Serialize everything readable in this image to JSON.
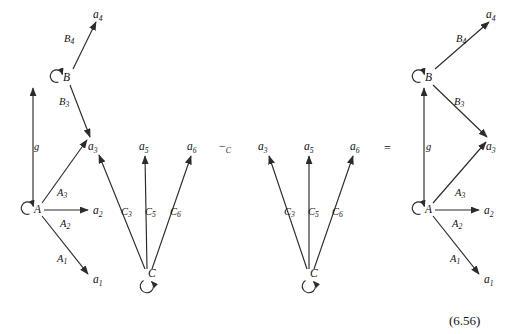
{
  "figure": {
    "equation_number": "(6.56)",
    "operators": [
      {
        "id": "minus-c",
        "symbol": "−",
        "subscript": "C",
        "x": 222,
        "y": 150
      },
      {
        "id": "equals",
        "symbol": "=",
        "subscript": "",
        "x": 388,
        "y": 152
      }
    ]
  },
  "diagrams": [
    {
      "id": "left-diagram",
      "nodes": [
        {
          "id": "B",
          "label": "B",
          "sub": "",
          "x": 63,
          "y": 77,
          "loop": "left"
        },
        {
          "id": "A",
          "label": "A",
          "sub": "",
          "x": 34,
          "y": 209,
          "loop": "left"
        },
        {
          "id": "C",
          "label": "C",
          "sub": "",
          "x": 148,
          "y": 277,
          "loop": "below"
        },
        {
          "id": "a4",
          "label": "a",
          "sub": "4",
          "x": 96,
          "y": 14,
          "loop": ""
        },
        {
          "id": "a3",
          "label": "a",
          "sub": "3",
          "x": 91,
          "y": 148,
          "loop": ""
        },
        {
          "id": "a5",
          "label": "a",
          "sub": "5",
          "x": 142,
          "y": 148,
          "loop": ""
        },
        {
          "id": "a6",
          "label": "a",
          "sub": "6",
          "x": 190,
          "y": 148,
          "loop": ""
        },
        {
          "id": "a2",
          "label": "a",
          "sub": "2",
          "x": 95,
          "y": 212,
          "loop": ""
        },
        {
          "id": "a1",
          "label": "a",
          "sub": "1",
          "x": 95,
          "y": 280,
          "loop": ""
        }
      ],
      "edges": [
        {
          "id": "B-a4",
          "from": "B",
          "to": "a4",
          "label": "B",
          "sub": "4",
          "lx": 67,
          "ly": 38
        },
        {
          "id": "B-a3",
          "from": "B",
          "to": "a3",
          "label": "B",
          "sub": "3",
          "lx": 62,
          "ly": 101
        },
        {
          "id": "A-B",
          "from": "A",
          "to": "B",
          "label": "g",
          "sub": "",
          "lx": 36,
          "ly": 146
        },
        {
          "id": "A-a3",
          "from": "A",
          "to": "a3",
          "label": "A",
          "sub": "3",
          "lx": 60,
          "ly": 192
        },
        {
          "id": "A-a2",
          "from": "A",
          "to": "a2",
          "label": "A",
          "sub": "2",
          "lx": 63,
          "ly": 223
        },
        {
          "id": "A-a1",
          "from": "A",
          "to": "a1",
          "label": "A",
          "sub": "1",
          "lx": 60,
          "ly": 258
        },
        {
          "id": "C-a3",
          "from": "C",
          "to": "a3",
          "label": "C",
          "sub": "3",
          "lx": 124,
          "ly": 211
        },
        {
          "id": "C-a5",
          "from": "C",
          "to": "a5",
          "label": "C",
          "sub": "5",
          "lx": 148,
          "ly": 211
        },
        {
          "id": "C-a6",
          "from": "C",
          "to": "a6",
          "label": "C",
          "sub": "6",
          "lx": 173,
          "ly": 211
        }
      ]
    },
    {
      "id": "middle-diagram",
      "nodes": [
        {
          "id": "C",
          "label": "C",
          "sub": "",
          "x": 310,
          "y": 277,
          "loop": "below"
        },
        {
          "id": "a3",
          "label": "a",
          "sub": "3",
          "x": 261,
          "y": 148,
          "loop": ""
        },
        {
          "id": "a5",
          "label": "a",
          "sub": "5",
          "x": 307,
          "y": 148,
          "loop": ""
        },
        {
          "id": "a6",
          "label": "a",
          "sub": "6",
          "x": 353,
          "y": 148,
          "loop": ""
        }
      ],
      "edges": [
        {
          "id": "C-a3",
          "from": "C",
          "to": "a3",
          "label": "C",
          "sub": "3",
          "lx": 287,
          "ly": 211
        },
        {
          "id": "C-a5",
          "from": "C",
          "to": "a5",
          "label": "C",
          "sub": "5",
          "lx": 311,
          "ly": 211
        },
        {
          "id": "C-a6",
          "from": "C",
          "to": "a6",
          "label": "C",
          "sub": "6",
          "lx": 335,
          "ly": 211
        }
      ]
    },
    {
      "id": "right-diagram",
      "nodes": [
        {
          "id": "B",
          "label": "B",
          "sub": "",
          "x": 425,
          "y": 77,
          "loop": "left"
        },
        {
          "id": "A",
          "label": "A",
          "sub": "",
          "x": 425,
          "y": 209,
          "loop": "left"
        },
        {
          "id": "a4",
          "label": "a",
          "sub": "4",
          "x": 489,
          "y": 14,
          "loop": ""
        },
        {
          "id": "a3",
          "label": "a",
          "sub": "3",
          "x": 489,
          "y": 148,
          "loop": ""
        },
        {
          "id": "a2",
          "label": "a",
          "sub": "2",
          "x": 486,
          "y": 212,
          "loop": ""
        },
        {
          "id": "a1",
          "label": "a",
          "sub": "1",
          "x": 486,
          "y": 280,
          "loop": ""
        }
      ],
      "edges": [
        {
          "id": "B-a4",
          "from": "B",
          "to": "a4",
          "label": "B",
          "sub": "4",
          "lx": 459,
          "ly": 38
        },
        {
          "id": "B-a3",
          "from": "B",
          "to": "a3",
          "label": "B",
          "sub": "3",
          "lx": 457,
          "ly": 101
        },
        {
          "id": "A-B",
          "from": "A",
          "to": "B",
          "label": "g",
          "sub": "",
          "lx": 428,
          "ly": 146
        },
        {
          "id": "A-a3",
          "from": "A",
          "to": "a3",
          "label": "A",
          "sub": "3",
          "lx": 458,
          "ly": 192
        },
        {
          "id": "A-a2",
          "from": "A",
          "to": "a2",
          "label": "A",
          "sub": "2",
          "lx": 455,
          "ly": 223
        },
        {
          "id": "A-a1",
          "from": "A",
          "to": "a1",
          "label": "A",
          "sub": "1",
          "lx": 453,
          "ly": 258
        }
      ]
    }
  ]
}
